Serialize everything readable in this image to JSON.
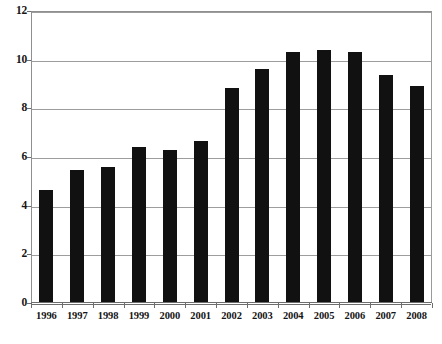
{
  "chart_data": {
    "type": "bar",
    "title": "",
    "subtitle": "",
    "xlabel": "",
    "ylabel": "",
    "categories": [
      "1996",
      "1997",
      "1998",
      "1999",
      "2000",
      "2001",
      "2002",
      "2003",
      "2004",
      "2005",
      "2006",
      "2007",
      "2008"
    ],
    "values": [
      4.65,
      5.45,
      5.6,
      6.4,
      6.3,
      6.65,
      8.85,
      9.6,
      10.3,
      10.4,
      10.3,
      9.35,
      8.9
    ],
    "series": [
      {
        "name": "",
        "values": [
          4.65,
          5.45,
          5.6,
          6.4,
          6.3,
          6.65,
          8.85,
          9.6,
          10.3,
          10.4,
          10.3,
          9.35,
          8.9
        ]
      }
    ],
    "ylim": [
      0,
      12
    ],
    "yticks": [
      0,
      2,
      4,
      6,
      8,
      10,
      12
    ],
    "ytick_labels": [
      "0",
      "2",
      "4",
      "6",
      "8",
      "10",
      "12"
    ],
    "grid": true,
    "grid_axis": "y",
    "legend": false,
    "legend_position": "none",
    "bar_color": "#111111",
    "gridline_color": "#9d9d9d",
    "axis_color": "#6d6d6d",
    "background_color": "#ffffff",
    "annotations": []
  }
}
